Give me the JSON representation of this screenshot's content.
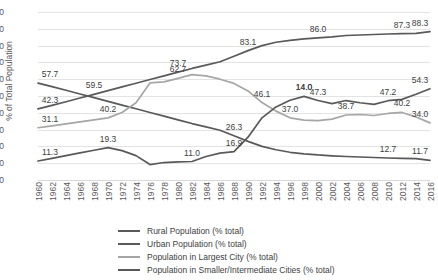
{
  "chart_data": {
    "type": "line",
    "title": "",
    "xlabel": "",
    "ylabel": "% of Total Population",
    "ylim": [
      0,
      100
    ],
    "ytick_step": 10,
    "yticks": [
      "100",
      "90",
      "80",
      "70",
      "60",
      "50",
      "40",
      "30",
      "20",
      "10",
      "0"
    ],
    "grid": true,
    "legend_position": "bottom",
    "x": [
      1960,
      1962,
      1964,
      1966,
      1968,
      1970,
      1972,
      1974,
      1976,
      1978,
      1980,
      1982,
      1984,
      1986,
      1988,
      1990,
      1992,
      1994,
      1996,
      1998,
      2000,
      2002,
      2004,
      2006,
      2008,
      2010,
      2012,
      2014,
      2016
    ],
    "categories": [
      "1960",
      "1962",
      "1964",
      "1966",
      "1968",
      "1970",
      "1972",
      "1974",
      "1976",
      "1978",
      "1980",
      "1982",
      "1984",
      "1986",
      "1988",
      "1990",
      "1992",
      "1994",
      "1996",
      "1998",
      "2000",
      "2002",
      "2004",
      "2006",
      "2008",
      "2010",
      "2012",
      "2014",
      "2016"
    ],
    "series": [
      {
        "name": "Rural Population (% total)",
        "color": "#595959",
        "values": [
          57.7,
          55.6,
          53.4,
          51.2,
          49.0,
          46.8,
          44.6,
          42.4,
          40.2,
          38.0,
          35.8,
          33.6,
          31.6,
          29.6,
          26.3,
          23.0,
          20.0,
          18.0,
          16.5,
          15.6,
          14.9,
          14.4,
          14.0,
          13.7,
          13.4,
          13.1,
          12.9,
          12.7,
          11.7
        ],
        "labels": [
          {
            "x": 1960,
            "value": "57.7"
          },
          {
            "x": 1988,
            "value": "26.3"
          },
          {
            "x": 2016,
            "value": "11.7"
          }
        ]
      },
      {
        "name": "Urban Population (% total)",
        "color": "#595959",
        "values": [
          42.3,
          44.4,
          46.6,
          48.8,
          51.0,
          53.2,
          55.4,
          57.6,
          59.8,
          62.0,
          64.2,
          66.4,
          68.4,
          70.4,
          73.7,
          77.0,
          80.0,
          82.0,
          83.1,
          84.0,
          84.6,
          85.2,
          86.0,
          86.3,
          86.6,
          86.9,
          87.1,
          87.3,
          88.3
        ],
        "labels": [
          {
            "x": 1960,
            "value": "42.3"
          },
          {
            "x": 1968,
            "value": "59.5"
          },
          {
            "x": 1980,
            "value": "73.7"
          },
          {
            "x": 1990,
            "value": "83.1"
          },
          {
            "x": 2000,
            "value": "86.0"
          },
          {
            "x": 2012,
            "value": "87.3"
          },
          {
            "x": 2016,
            "value": "88.3"
          }
        ]
      },
      {
        "name": "Population in Largest City (% total)",
        "color": "#a6a6a6",
        "values": [
          31.1,
          32.2,
          33.4,
          34.6,
          35.8,
          37.0,
          40.2,
          46.0,
          57.8,
          58.4,
          60.5,
          62.7,
          62.0,
          60.0,
          57.5,
          53.0,
          46.1,
          41.0,
          37.0,
          35.6,
          35.4,
          36.2,
          38.7,
          39.0,
          38.4,
          39.6,
          40.2,
          37.5,
          34.0
        ],
        "labels": [
          {
            "x": 1960,
            "value": "31.1"
          },
          {
            "x": 1970,
            "value": "40.2"
          },
          {
            "x": 1980,
            "value": "62.7"
          },
          {
            "x": 1992,
            "value": "46.1"
          },
          {
            "x": 1996,
            "value": "37.0"
          },
          {
            "x": 2004,
            "value": "38.7"
          },
          {
            "x": 2012,
            "value": "40.2"
          },
          {
            "x": 2016,
            "value": "34.0"
          }
        ]
      },
      {
        "name": "Population in Smaller/Intermediate Cities (% total)",
        "color": "#595959",
        "values": [
          11.3,
          12.9,
          14.5,
          16.1,
          17.7,
          19.3,
          17.5,
          14.5,
          9.2,
          10.4,
          10.8,
          11.0,
          14.0,
          16.0,
          16.9,
          25.5,
          37.0,
          43.5,
          47.5,
          49.8,
          47.3,
          45.5,
          47.3,
          46.0,
          45.0,
          47.2,
          48.0,
          51.0,
          54.3
        ],
        "labels": [
          {
            "x": 1960,
            "value": "11.3"
          },
          {
            "x": 1970,
            "value": "19.3"
          },
          {
            "x": 1982,
            "value": "11.0"
          },
          {
            "x": 1988,
            "value": "16.9"
          },
          {
            "x": 1998,
            "value": "14.0"
          },
          {
            "x": 2000,
            "value": "47.3"
          },
          {
            "x": 2010,
            "value": "47.2"
          },
          {
            "x": 2016,
            "value": "54.3"
          }
        ]
      }
    ],
    "extra_labels": [
      {
        "series": 3,
        "x": 1998,
        "value": "14.0",
        "note": "rural-series-label-at-1998"
      },
      {
        "series": 0,
        "x": 2010,
        "value": "12.7",
        "note": "rural-series-label-at-2012"
      }
    ]
  },
  "legend": {
    "items": [
      {
        "label": "Rural Population (% total)",
        "color": "#595959"
      },
      {
        "label": "Urban Population (% total)",
        "color": "#595959"
      },
      {
        "label": "Population in Largest City (% total)",
        "color": "#a6a6a6"
      },
      {
        "label": "Population in Smaller/Intermediate Cities (% total)",
        "color": "#595959"
      }
    ]
  }
}
